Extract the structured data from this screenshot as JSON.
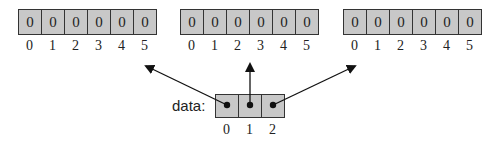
{
  "arrays": [
    {
      "values": [
        "0",
        "0",
        "0",
        "0",
        "0",
        "0"
      ],
      "indices": [
        "0",
        "1",
        "2",
        "3",
        "4",
        "5"
      ]
    },
    {
      "values": [
        "0",
        "0",
        "0",
        "0",
        "0",
        "0"
      ],
      "indices": [
        "0",
        "1",
        "2",
        "3",
        "4",
        "5"
      ]
    },
    {
      "values": [
        "0",
        "0",
        "0",
        "0",
        "0",
        "0"
      ],
      "indices": [
        "0",
        "1",
        "2",
        "3",
        "4",
        "5"
      ]
    }
  ],
  "data_array": {
    "label": "data:",
    "indices": [
      "0",
      "1",
      "2"
    ]
  },
  "colors": {
    "cell_fill": "#c8c8c8",
    "stroke": "#222222"
  }
}
